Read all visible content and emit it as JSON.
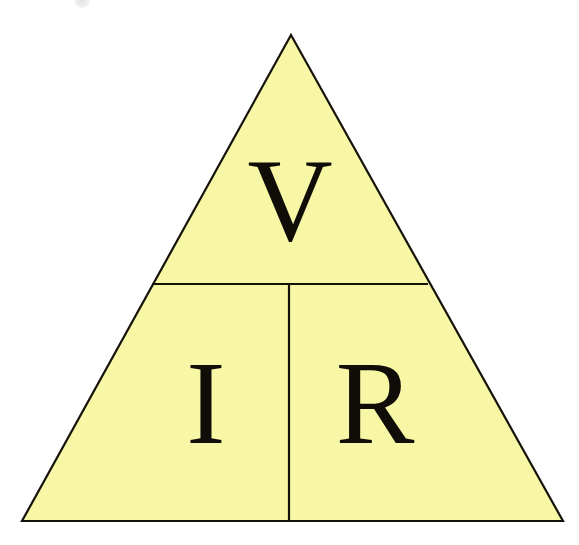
{
  "figure": {
    "name": "ohms-law-triangle",
    "background_color": "#ffffff",
    "fill_color": "#f7f7a5",
    "stroke_color": "#15120a",
    "text_color": "#100d08",
    "stroke_width": 2.2,
    "geometry": {
      "apex": {
        "x": 291,
        "y": 35
      },
      "bottom_left": {
        "x": 22,
        "y": 521
      },
      "bottom_right": {
        "x": 563,
        "y": 521
      },
      "horizontal_divider": {
        "x1": 152,
        "y1": 284,
        "x2": 428,
        "y2": 284
      },
      "vertical_divider": {
        "x1": 289,
        "y1": 284,
        "x2": 289,
        "y2": 521
      }
    }
  },
  "chart_data": {
    "type": "diagram",
    "categories": [
      "V",
      "I",
      "R"
    ],
    "cells": [
      {
        "id": "top",
        "label": "V",
        "meaning": "Voltage",
        "x": 290,
        "y": 240,
        "font_size": 118
      },
      {
        "id": "bottom-left",
        "label": "I",
        "meaning": "Current",
        "x": 206,
        "y": 443,
        "font_size": 118
      },
      {
        "id": "bottom-right",
        "label": "R",
        "meaning": "Resistance",
        "x": 375,
        "y": 443,
        "font_size": 118
      }
    ]
  },
  "labels": {
    "top": "V",
    "bottom_left": "I",
    "bottom_right": "R"
  }
}
